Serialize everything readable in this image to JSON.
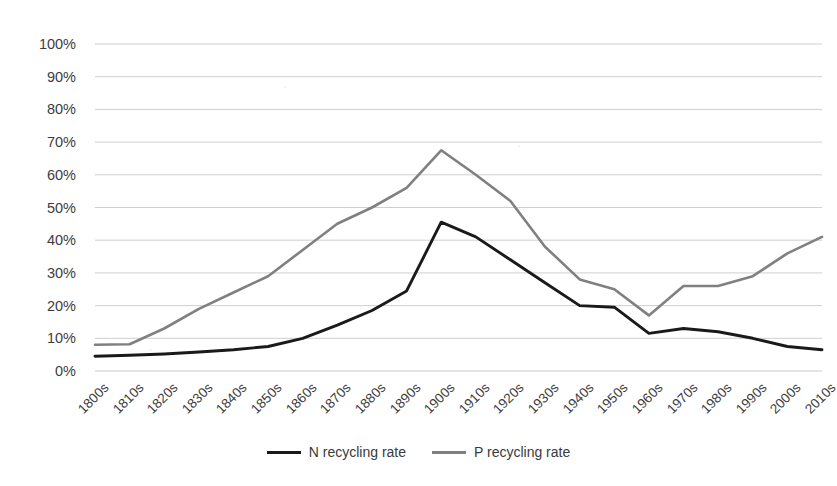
{
  "chart_data": {
    "type": "line",
    "title": "",
    "subtitle": "",
    "xlabel": "",
    "ylabel": "",
    "ylim": [
      0,
      100
    ],
    "ytick_labels": [
      "100%",
      "90%",
      "80%",
      "70%",
      "60%",
      "50%",
      "40%",
      "30%",
      "20%",
      "10%",
      "0%"
    ],
    "ytick_values": [
      100,
      90,
      80,
      70,
      60,
      50,
      40,
      30,
      20,
      10,
      0
    ],
    "grid": true,
    "legend_position": "bottom",
    "categories": [
      "1800s",
      "1810s",
      "1820s",
      "1830s",
      "1840s",
      "1850s",
      "1860s",
      "1870s",
      "1880s",
      "1890s",
      "1900s",
      "1910s",
      "1920s",
      "1930s",
      "1940s",
      "1950s",
      "1960s",
      "1970s",
      "1980s",
      "1990s",
      "2000s",
      "2010s"
    ],
    "series": [
      {
        "name": "N recycling rate",
        "color": "#1a1a1a",
        "values": [
          4.5,
          4.8,
          5.2,
          5.8,
          6.5,
          7.5,
          10.0,
          14.0,
          18.5,
          24.5,
          45.5,
          41.0,
          34.0,
          27.0,
          20.0,
          19.5,
          11.5,
          13.0,
          12.0,
          10.0,
          7.5,
          6.5
        ]
      },
      {
        "name": "P recycling rate",
        "color": "#808080",
        "values": [
          8.0,
          8.2,
          13.0,
          19.0,
          24.0,
          29.0,
          37.0,
          45.0,
          50.0,
          56.0,
          67.5,
          60.0,
          52.0,
          38.0,
          28.0,
          25.0,
          17.0,
          26.0,
          26.0,
          29.0,
          36.0,
          41.0
        ]
      }
    ]
  },
  "legend": {
    "items": [
      {
        "label": "N recycling rate"
      },
      {
        "label": "P recycling rate"
      }
    ]
  }
}
